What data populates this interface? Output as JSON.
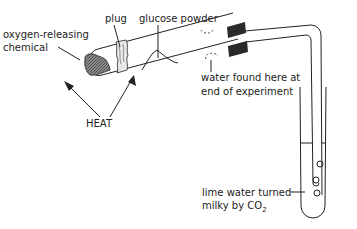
{
  "diagram": {
    "title": "",
    "labels": {
      "oxygen_line1": "oxygen-releasing",
      "oxygen_line2": "chemical",
      "plug": "plug",
      "glucose": "glucose powder",
      "water_line1": "water found here at",
      "water_line2": "end of experiment",
      "heat": "HEAT",
      "lime_line1": "lime water turned",
      "lime_line2": "milky by CO",
      "lime_sub": "2"
    },
    "colors": {
      "ink": "#222222",
      "chemical_fill": "#777777",
      "bung": "#2a2a2a",
      "background": "#ffffff"
    }
  }
}
